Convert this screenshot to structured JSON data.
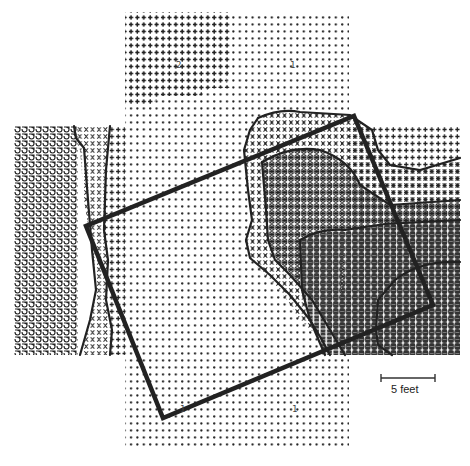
{
  "figure": {
    "type": "character contour map",
    "symbols": [
      {
        "glyph": "•",
        "meaning": "level 1 (lowest density)"
      },
      {
        "glyph": "+",
        "meaning": "level 2"
      },
      {
        "glyph": "X",
        "meaning": "level 3"
      },
      {
        "glyph": "Ө",
        "meaning": "level 4"
      },
      {
        "glyph": "▓",
        "meaning": "level 5 (highest density)"
      },
      {
        "glyph": "ძ",
        "meaning": "left-wing level"
      }
    ],
    "zone_labels": [
      {
        "text": "2",
        "x": 176,
        "y": 66
      },
      {
        "text": "1",
        "x": 290,
        "y": 66
      },
      {
        "text": "1",
        "x": 180,
        "y": 410
      },
      {
        "text": "1",
        "x": 292,
        "y": 410
      }
    ],
    "overlay_square": {
      "corners": [
        [
          354,
          116
        ],
        [
          433,
          305
        ],
        [
          163,
          418
        ],
        [
          86,
          226
        ]
      ],
      "color": "#222222"
    },
    "scale_bar": {
      "label": "5 feet",
      "x1": 381,
      "x2": 435,
      "y": 378
    }
  },
  "colors": {
    "ink": "#222222",
    "paper": "#ffffff"
  }
}
